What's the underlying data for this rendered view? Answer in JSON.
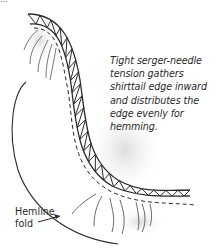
{
  "figure": {
    "top_fragment": "...",
    "caption_lines": [
      "Tight serger-needle",
      "tension gathers",
      "shirttail edge inward",
      "and distributes the",
      "edge evenly for",
      "hemming."
    ],
    "hemline_label_lines": [
      "Hemline",
      "fold"
    ],
    "colors": {
      "ink": "#2a2a2a",
      "shading": "#cfcfcf",
      "background": "#ffffff"
    }
  }
}
